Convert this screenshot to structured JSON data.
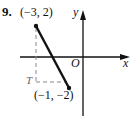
{
  "problem": {
    "number": "9."
  },
  "diagram": {
    "axes": {
      "x_label": "x",
      "y_label": "y",
      "origin_label": "O"
    },
    "points": [
      {
        "name": "start",
        "label": "(−3, 2)",
        "x": -3,
        "y": 2
      },
      {
        "name": "end",
        "label": "(−1, −2)",
        "x": -1,
        "y": -2
      }
    ],
    "corner_label": "T",
    "colors": {
      "ink": "#111111",
      "background": "#ffffff"
    }
  }
}
